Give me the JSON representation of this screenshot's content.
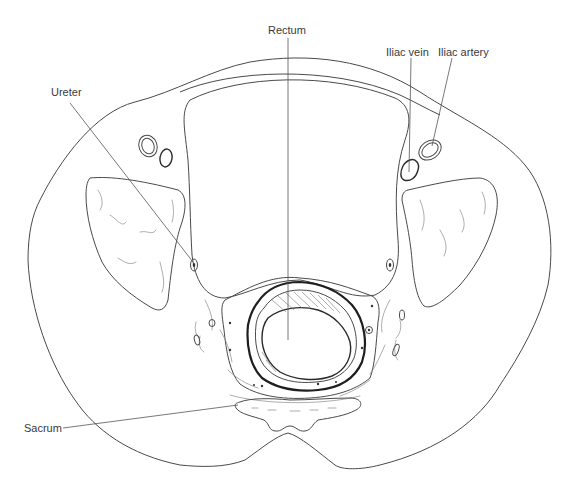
{
  "figure": {
    "type": "anatomical cross-section illustration",
    "labels": {
      "rectum": "Rectum",
      "iliac_vein": "Iliac vein",
      "iliac_artery": "Iliac artery",
      "ureter": "Ureter",
      "sacrum": "Sacrum"
    },
    "colors": {
      "line": "#4a4a4a",
      "text": "#3a3a3a",
      "background": "#ffffff"
    }
  }
}
